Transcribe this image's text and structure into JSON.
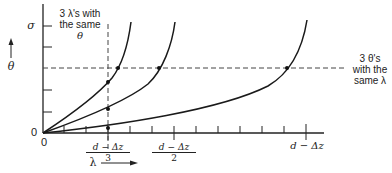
{
  "diagram": {
    "y_axis": {
      "label": "θ",
      "top_label": "σ",
      "origin_label": "0"
    },
    "x_axis": {
      "label": "λ",
      "origin_label": "0",
      "tick_labels": [
        {
          "num": "d − Δz",
          "den": "3"
        },
        {
          "num": "d − Δz",
          "den": "2"
        },
        {
          "single": "d − Δz"
        }
      ]
    },
    "annotations": {
      "vertical_note": [
        "3 λ's with",
        "the same",
        "θ"
      ],
      "horizontal_note": [
        "3 θ's",
        "with the",
        "same λ"
      ]
    },
    "curves": [
      "curve-1",
      "curve-2",
      "curve-3"
    ]
  }
}
